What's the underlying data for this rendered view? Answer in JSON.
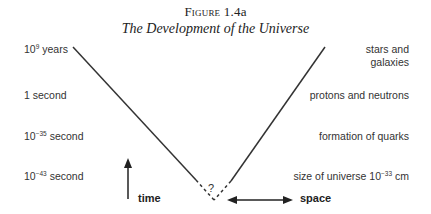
{
  "figure": {
    "number_prefix": "Figure",
    "number": "1.4a",
    "title": "The Development of the Universe"
  },
  "time_labels": [
    {
      "base": "10",
      "exponent": "9",
      "unit": "years"
    },
    {
      "base": "",
      "exponent": "",
      "unit": "1 second"
    },
    {
      "base": "10",
      "exponent": "−35",
      "unit": "second"
    },
    {
      "base": "10",
      "exponent": "−43",
      "unit": "second"
    }
  ],
  "event_labels": [
    {
      "line1": "stars and",
      "line2": "galaxies"
    },
    {
      "line1": "protons and neutrons"
    },
    {
      "line1": "formation of quarks"
    },
    {
      "prefix": "size of universe 10",
      "exponent": "−33",
      "suffix": "cm"
    }
  ],
  "cone": {
    "unknown_marker": "?"
  },
  "axes": {
    "time_label": "time",
    "space_label": "space"
  }
}
